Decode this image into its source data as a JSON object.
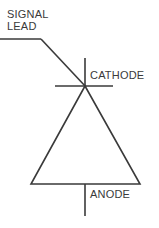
{
  "diagram": {
    "background_color": "#ffffff",
    "line_color": "#3a3a3a",
    "text_color": "#3a3a3a",
    "labels": {
      "signal_lead": "SIGNAL\nLEAD",
      "signal_lead_line1": "SIGNAL",
      "signal_lead_line2": "LEAD",
      "cathode": "CATHODE",
      "anode": "ANODE"
    },
    "geometry": {
      "signal_lead_horizontal": {
        "x1": 0,
        "y1": 39,
        "x2": 41,
        "y2": 39
      },
      "signal_lead_diagonal": {
        "x1": 41,
        "y1": 39,
        "x2": 85,
        "y2": 86
      },
      "cathode_lead_vertical": {
        "x1": 85,
        "y1": 58,
        "x2": 85,
        "y2": 86
      },
      "cathode_bar": {
        "x1": 55,
        "y1": 86,
        "x2": 113,
        "y2": 86
      },
      "triangle": {
        "apex_x": 85,
        "apex_y": 86,
        "base_left_x": 31,
        "base_right_x": 140,
        "base_y": 184
      },
      "anode_lead_vertical": {
        "x1": 85,
        "y1": 184,
        "x2": 85,
        "y2": 216
      }
    }
  }
}
